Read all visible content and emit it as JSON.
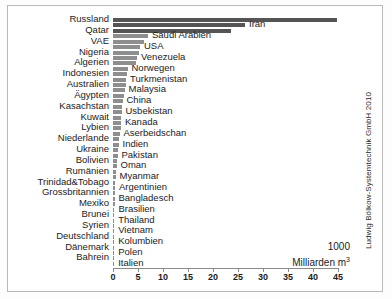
{
  "credit": "Ludwig Bölkow-Systemtechnik GmbH 2010",
  "unit_line1": "1000",
  "unit_line2": "Milliarden m³",
  "axis": {
    "ticks": [
      "0",
      "5",
      "10",
      "15",
      "20",
      "25",
      "30",
      "35",
      "40",
      "45"
    ],
    "min": 0,
    "max": 45
  },
  "colors": {
    "bar": "#8e8e8e",
    "bar_top": "#555555",
    "axis": "#8a8a8a",
    "text": "#1b1b1b",
    "frame": "#b9b9b9",
    "background": "#ffffff"
  },
  "chart_data": {
    "type": "bar",
    "title": "",
    "subtitle": "",
    "xlabel": "1000 Milliarden m³",
    "ylabel": "",
    "xlim": [
      0,
      45
    ],
    "grid": false,
    "legend": "none",
    "orientation": "horizontal",
    "annotation": "Ludwig Bölkow-Systemtechnik GmbH 2010",
    "categories": [
      "Russland",
      "Iran",
      "Qatar",
      "Saudi Arabien",
      "VAE",
      "USA",
      "Nigeria",
      "Venezuela",
      "Algerien",
      "Norwegen",
      "Indonesien",
      "Turkmenistan",
      "Australien",
      "Malaysia",
      "Ägypten",
      "China",
      "Kasachstan",
      "Usbekistan",
      "Kuwait",
      "Kanada",
      "Lybien",
      "Aserbeidschan",
      "Niederlande",
      "Indien",
      "Ukraine",
      "Pakistan",
      "Bolivien",
      "Oman",
      "Rumänien",
      "Myanmar",
      "Trinidad&Tobago",
      "Argentinien",
      "Grossbritannien",
      "Bangladesch",
      "Mexiko",
      "Brasilien",
      "Brunei",
      "Thailand",
      "Syrien",
      "Vietnam",
      "Deutschland",
      "Kolumbien",
      "Dänemark",
      "Polen",
      "Bahrein",
      "Italien"
    ],
    "values": [
      44.8,
      26.4,
      23.6,
      7.0,
      6.1,
      5.4,
      5.2,
      4.8,
      4.5,
      2.9,
      2.7,
      2.6,
      2.5,
      2.3,
      2.2,
      1.9,
      1.8,
      1.7,
      1.6,
      1.6,
      1.5,
      1.3,
      1.2,
      1.1,
      1.0,
      0.9,
      0.8,
      0.7,
      0.6,
      0.5,
      0.45,
      0.4,
      0.35,
      0.3,
      0.3,
      0.28,
      0.25,
      0.22,
      0.2,
      0.2,
      0.18,
      0.15,
      0.12,
      0.1,
      0.1,
      0.08
    ],
    "label_side": [
      "left",
      "right",
      "left",
      "right",
      "left",
      "right",
      "left",
      "right",
      "left",
      "right",
      "left",
      "right",
      "left",
      "right",
      "left",
      "right",
      "left",
      "right",
      "left",
      "right",
      "left",
      "right",
      "left",
      "right",
      "left",
      "right",
      "left",
      "right",
      "left",
      "right",
      "left",
      "right",
      "left",
      "right",
      "left",
      "right",
      "left",
      "right",
      "left",
      "right",
      "left",
      "right",
      "left",
      "right",
      "left",
      "right"
    ]
  }
}
